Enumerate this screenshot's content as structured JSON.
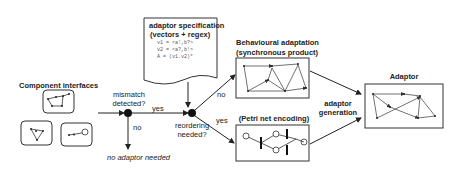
{
  "component_interfaces": {
    "title": "Component interfaces"
  },
  "decision_mismatch": {
    "label_line1": "mismatch",
    "label_line2": "detected?",
    "yes": "yes",
    "no": "no"
  },
  "no_adaptor": {
    "label": "no adaptor needed"
  },
  "adaptor_spec": {
    "title_line1": "adaptor specification",
    "title_line2": "(vectors + regex)",
    "lines": [
      "v1 = <a!,b?>",
      "v2 = <a?,b!>",
      "A = (v1.v2)*"
    ]
  },
  "decision_reordering": {
    "label_line1": "reordering",
    "label_line2": "needed?",
    "no": "no",
    "yes": "yes"
  },
  "behavioural": {
    "title_line1": "Behavioural adaptation",
    "title_line2": "(synchronous product)"
  },
  "petri": {
    "title": "(Petri net encoding)"
  },
  "generation": {
    "label_line1": "adaptor",
    "label_line2": "generation"
  },
  "adaptor": {
    "title": "Adaptor"
  }
}
